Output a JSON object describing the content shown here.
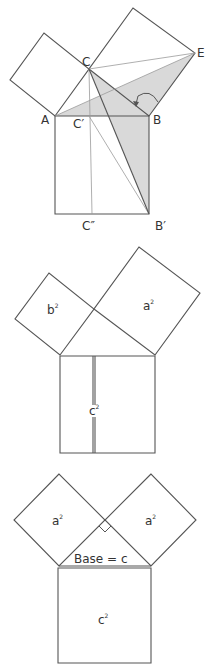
{
  "figures": [
    {
      "id": "figure-1-euclid-proof",
      "labels": {
        "A": "A",
        "B": "B",
        "C": "C",
        "E": "E",
        "C_prime": "C′",
        "C_double_prime": "C″",
        "B_prime": "B′"
      },
      "points": {
        "A": [
          55,
          116
        ],
        "B": [
          149,
          116
        ],
        "C": [
          89,
          69
        ],
        "E": [
          195,
          53
        ],
        "C_prime": [
          89,
          116
        ],
        "C_double_prime": [
          92,
          214
        ],
        "B_prime": [
          149,
          214
        ]
      },
      "shade_color": "#d9d9d9"
    },
    {
      "id": "figure-2-squares",
      "labels": {
        "small_square": "b",
        "large_square": "a",
        "hyp_square": "c",
        "exponent": "2"
      }
    },
    {
      "id": "figure-3-isosceles",
      "labels": {
        "left_square": "a",
        "right_square": "a",
        "bottom_square": "c",
        "exponent": "2",
        "base_caption": "Base = c"
      }
    }
  ],
  "colors": {
    "stroke": "#555555",
    "thin_stroke": "#9a9a9a",
    "shade": "#d9d9d9",
    "text": "#333333"
  }
}
